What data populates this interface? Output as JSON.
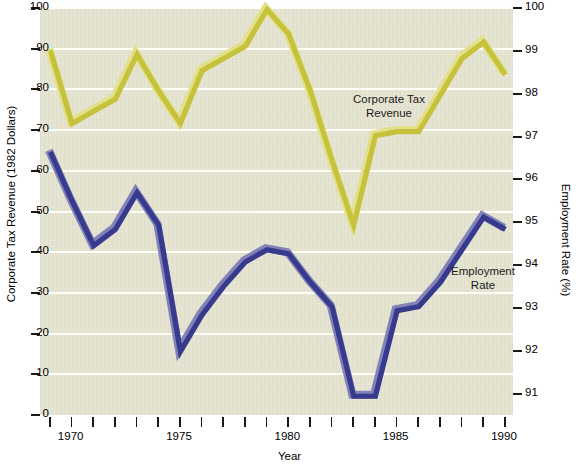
{
  "chart_data": {
    "type": "line",
    "title": "",
    "xlabel": "Year",
    "ylabel": "Corporate Tax Revenue (1982 Dollars)",
    "ylabel_right": "Employment Rate (%)",
    "xlim": [
      1969,
      1990
    ],
    "ylim": [
      0,
      100
    ],
    "ylim_right": [
      90.5,
      100
    ],
    "grid": true,
    "legend_position": "inline-annotation",
    "x": [
      1969,
      1970,
      1971,
      1972,
      1973,
      1974,
      1975,
      1976,
      1977,
      1978,
      1979,
      1980,
      1981,
      1982,
      1983,
      1984,
      1985,
      1986,
      1987,
      1988,
      1989,
      1990
    ],
    "xticks": [
      1970,
      1975,
      1980,
      1985,
      1990
    ],
    "xticks_all": [
      1969,
      1970,
      1971,
      1972,
      1973,
      1974,
      1975,
      1976,
      1977,
      1978,
      1979,
      1980,
      1981,
      1982,
      1983,
      1984,
      1985,
      1986,
      1987,
      1988,
      1989,
      1990
    ],
    "yticks_left": [
      0,
      10,
      20,
      30,
      40,
      50,
      60,
      70,
      80,
      90,
      100
    ],
    "yticks_right": [
      91,
      92,
      93,
      94,
      95,
      96,
      97,
      98,
      99,
      100
    ],
    "series": [
      {
        "name": "Corporate Tax Revenue",
        "axis": "left",
        "color": "#c6c23c",
        "highlight_color": "#e2e08a",
        "values": [
          90,
          72,
          75,
          78,
          89,
          80,
          72,
          85,
          88,
          91,
          100,
          94,
          80,
          63,
          47,
          69,
          70,
          70,
          79,
          88,
          92,
          84
        ]
      },
      {
        "name": "Employment Rate",
        "axis": "left-scaled-to-right",
        "color": "#383a8e",
        "highlight_color": "#8183b8",
        "values": [
          65,
          53,
          42,
          46,
          55,
          47,
          16,
          25,
          32,
          38,
          41,
          40,
          33,
          27,
          5,
          5,
          26,
          27,
          33,
          41,
          49,
          46
        ]
      }
    ],
    "annotations": [
      {
        "id": "corporate-tax-revenue-label",
        "text": "Corporate Tax\nRevenue"
      },
      {
        "id": "employment-rate-label",
        "text": "Employment\nRate"
      }
    ],
    "colors": {
      "plot_background": "#e4e3d0",
      "gridline": "#fdfdf6",
      "axis": "#1a1a1a",
      "yellow_series": "#c6c23c",
      "blue_series": "#383a8e"
    }
  }
}
